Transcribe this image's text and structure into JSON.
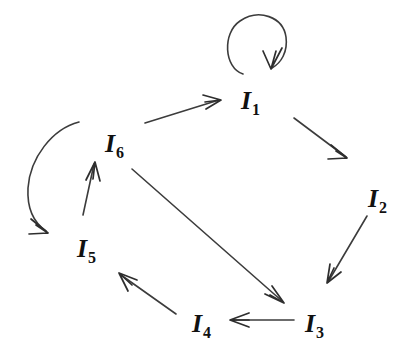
{
  "diagram": {
    "type": "directed-graph",
    "background_color": "#ffffff",
    "stroke_color": "#3c3c3c",
    "label_color": "#111111",
    "nodes": [
      {
        "id": "I1",
        "base": "I",
        "subscript": "1",
        "x": 250,
        "y": 101
      },
      {
        "id": "I2",
        "base": "I",
        "subscript": "2",
        "x": 377,
        "y": 199
      },
      {
        "id": "I3",
        "base": "I",
        "subscript": "3",
        "x": 314,
        "y": 324
      },
      {
        "id": "I4",
        "base": "I",
        "subscript": "4",
        "x": 201,
        "y": 324
      },
      {
        "id": "I5",
        "base": "I",
        "subscript": "5",
        "x": 86,
        "y": 249
      },
      {
        "id": "I6",
        "base": "I",
        "subscript": "6",
        "x": 114,
        "y": 144
      }
    ],
    "edges": [
      {
        "id": "e-I1-I1",
        "from": "I1",
        "to": "I1",
        "kind": "self-loop"
      },
      {
        "id": "e-I6-I1",
        "from": "I6",
        "to": "I1",
        "kind": "straight"
      },
      {
        "id": "e-I1-I2",
        "from": "I1",
        "to": "I2",
        "kind": "straight"
      },
      {
        "id": "e-I2-I3",
        "from": "I2",
        "to": "I3",
        "kind": "straight"
      },
      {
        "id": "e-I3-I4",
        "from": "I3",
        "to": "I4",
        "kind": "straight"
      },
      {
        "id": "e-I4-I5",
        "from": "I4",
        "to": "I5",
        "kind": "straight"
      },
      {
        "id": "e-I5-I6",
        "from": "I5",
        "to": "I6",
        "kind": "straight"
      },
      {
        "id": "e-I6-I3",
        "from": "I6",
        "to": "I3",
        "kind": "straight"
      },
      {
        "id": "e-I6-I5",
        "from": "I6",
        "to": "I5",
        "kind": "curved-arc"
      }
    ]
  }
}
